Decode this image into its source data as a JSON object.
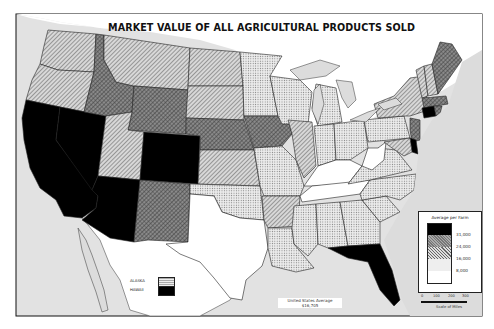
{
  "title": "MARKET VALUE OF ALL AGRICULTURAL PRODUCTS SOLD",
  "legend": {
    "title": "Average per Farm",
    "breaks": [
      "31,000",
      "24,000",
      "16,000",
      "8,000"
    ],
    "classes": [
      {
        "id": "c1",
        "label": "over 31,000",
        "fill": "#000000"
      },
      {
        "id": "c2",
        "label": "24,000 - 31,000",
        "fill": "pattern-cross-dark"
      },
      {
        "id": "c3",
        "label": "16,000 - 24,000",
        "fill": "pattern-diag"
      },
      {
        "id": "c4",
        "label": "8,000 - 16,000",
        "fill": "pattern-dots"
      },
      {
        "id": "c5",
        "label": "under 8,000",
        "fill": "#ffffff"
      }
    ]
  },
  "inset": {
    "alaska_label": "ALASKA",
    "hawaii_label": "HAWAII",
    "alaska_class": "c4",
    "hawaii_class": "c1"
  },
  "average": {
    "label": "United States Average",
    "value": "$16,705"
  },
  "scale": {
    "ticks": [
      "0",
      "100",
      "200",
      "300"
    ],
    "label": "Scale of Miles"
  },
  "states": {
    "WA": "c3",
    "OR": "c3",
    "CA": "c1",
    "NV": "c1",
    "ID": "c2",
    "MT": "c3",
    "WY": "c2",
    "UT": "c3",
    "AZ": "c1",
    "CO": "c1",
    "NM": "c2",
    "ND": "c3",
    "SD": "c3",
    "NE": "c2",
    "KS": "c3",
    "OK": "c4",
    "TX": "c5",
    "MN": "c4",
    "IA": "c2",
    "MO": "c4",
    "AR": "c3",
    "LA": "c4",
    "WI": "c4",
    "IL": "c3",
    "MI": "c4",
    "IN": "c4",
    "OH": "c4",
    "KY": "c5",
    "TN": "c5",
    "MS": "c4",
    "AL": "c4",
    "GA": "c4",
    "FL": "c1",
    "SC": "c4",
    "NC": "c4",
    "VA": "c4",
    "WV": "c5",
    "PA": "c4",
    "NY": "c3",
    "VT": "c3",
    "NH": "c3",
    "ME": "c2",
    "MA": "c2",
    "CT": "c1",
    "RI": "c2",
    "NJ": "c2",
    "DE": "c1",
    "MD": "c3"
  }
}
